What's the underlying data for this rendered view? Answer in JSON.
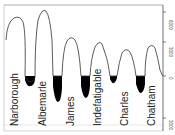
{
  "diagram": {
    "title": "",
    "type": "elevation-profile",
    "axis": {
      "ticks": [
        {
          "label": "6000",
          "y": 12
        },
        {
          "label": "3000",
          "y": 42
        },
        {
          "label": "0",
          "y": 76
        },
        {
          "label": "3000",
          "y": 122
        }
      ]
    },
    "islands": [
      {
        "name": "Narborough",
        "label_x": 17
      },
      {
        "name": "Albemarle",
        "label_x": 44
      },
      {
        "name": "James",
        "label_x": 72
      },
      {
        "name": "Indefatigable",
        "label_x": 100
      },
      {
        "name": "Charles",
        "label_x": 126
      },
      {
        "name": "Chatham",
        "label_x": 153
      }
    ],
    "colors": {
      "line": "#333333",
      "fill_below_sea": "#000000",
      "background": "#ffffff"
    }
  }
}
